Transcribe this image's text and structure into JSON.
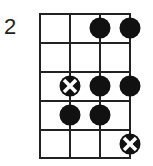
{
  "diagram": {
    "type": "fretboard-scale-diagram",
    "start_fret_label": "2",
    "strings": 4,
    "frets": 5,
    "markers": [
      {
        "fret": 1,
        "string": 3,
        "kind": "dot"
      },
      {
        "fret": 1,
        "string": 4,
        "kind": "dot"
      },
      {
        "fret": 3,
        "string": 2,
        "kind": "root-x"
      },
      {
        "fret": 3,
        "string": 3,
        "kind": "dot"
      },
      {
        "fret": 3,
        "string": 4,
        "kind": "dot"
      },
      {
        "fret": 4,
        "string": 2,
        "kind": "dot"
      },
      {
        "fret": 4,
        "string": 3,
        "kind": "dot"
      },
      {
        "fret": 5,
        "string": 4,
        "kind": "root-x"
      }
    ],
    "colors": {
      "line": "#222222",
      "dot": "#111111",
      "background": "#ffffff"
    }
  }
}
